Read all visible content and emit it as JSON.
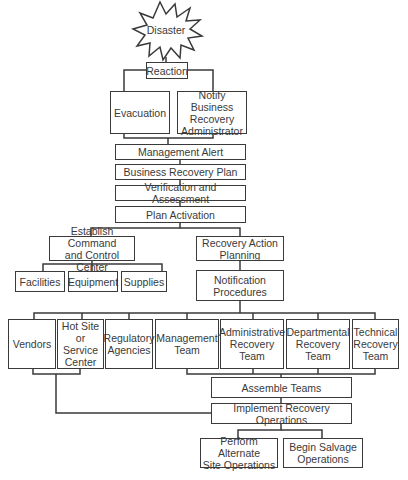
{
  "diagram": {
    "nodes": {
      "disaster": "Disaster",
      "reaction": "Reaction",
      "evacuation": "Evacuation",
      "notify": "Notify Business\nRecovery\nAdministrator",
      "management_alert": "Management Alert",
      "business_recovery_plan": "Business Recovery Plan",
      "verification": "Verification and Assessment",
      "plan_activation": "Plan Activation",
      "command_center": "Establish Command\nand Control Center",
      "recovery_action": "Recovery Action\nPlanning",
      "facilities": "Facilities",
      "equipment": "Equipment",
      "supplies": "Supplies",
      "notification_procedures": "Notification\nProcedures",
      "vendors": "Vendors",
      "hot_site": "Hot Site or\nService\nCenter",
      "regulatory": "Regulatory\nAgencies",
      "management_team": "Management\nTeam",
      "admin_team": "Administrative\nRecovery\nTeam",
      "departmental_team": "Departmental\nRecovery\nTeam",
      "technical_team": "Technical\nRecovery\nTeam",
      "assemble_teams": "Assemble Teams",
      "implement": "Implement Recovery Operations",
      "alternate_site": "Perform Alternate\nSite Operations",
      "salvage": "Begin Salvage\nOperations"
    },
    "edges": [
      [
        "disaster",
        "reaction"
      ],
      [
        "reaction",
        "evacuation"
      ],
      [
        "reaction",
        "notify"
      ],
      [
        "evacuation",
        "management_alert"
      ],
      [
        "notify",
        "management_alert"
      ],
      [
        "management_alert",
        "business_recovery_plan"
      ],
      [
        "business_recovery_plan",
        "verification"
      ],
      [
        "verification",
        "plan_activation"
      ],
      [
        "plan_activation",
        "command_center"
      ],
      [
        "plan_activation",
        "recovery_action"
      ],
      [
        "command_center",
        "facilities"
      ],
      [
        "command_center",
        "equipment"
      ],
      [
        "command_center",
        "supplies"
      ],
      [
        "recovery_action",
        "notification_procedures"
      ],
      [
        "notification_procedures",
        "vendors"
      ],
      [
        "notification_procedures",
        "hot_site"
      ],
      [
        "notification_procedures",
        "regulatory"
      ],
      [
        "notification_procedures",
        "management_team"
      ],
      [
        "notification_procedures",
        "admin_team"
      ],
      [
        "notification_procedures",
        "departmental_team"
      ],
      [
        "notification_procedures",
        "technical_team"
      ],
      [
        "vendors",
        "implement"
      ],
      [
        "hot_site",
        "implement"
      ],
      [
        "management_team",
        "assemble_teams"
      ],
      [
        "admin_team",
        "assemble_teams"
      ],
      [
        "departmental_team",
        "assemble_teams"
      ],
      [
        "technical_team",
        "assemble_teams"
      ],
      [
        "assemble_teams",
        "implement"
      ],
      [
        "implement",
        "alternate_site"
      ],
      [
        "implement",
        "salvage"
      ]
    ]
  }
}
